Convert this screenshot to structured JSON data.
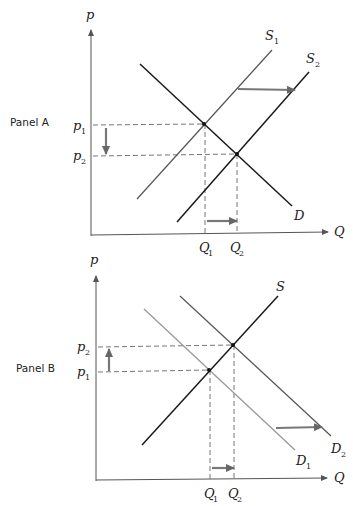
{
  "panels": [
    {
      "id": "A",
      "label": "Panel A",
      "axes": {
        "y": "p",
        "x": "Q"
      },
      "curves": {
        "supply_old": {
          "name": "S",
          "sub": "1"
        },
        "supply_new": {
          "name": "S",
          "sub": "2"
        },
        "demand": {
          "name": "D",
          "sub": ""
        }
      },
      "prices": [
        {
          "name": "p",
          "sub": "1"
        },
        {
          "name": "p",
          "sub": "2"
        }
      ],
      "quantities": [
        {
          "name": "Q",
          "sub": "1"
        },
        {
          "name": "Q",
          "sub": "2"
        }
      ],
      "description": "Supply shifts right from S1 to S2; price falls from p1 to p2; quantity rises from Q1 to Q2"
    },
    {
      "id": "B",
      "label": "Panel B",
      "axes": {
        "y": "p",
        "x": "Q"
      },
      "curves": {
        "supply": {
          "name": "S",
          "sub": ""
        },
        "demand_old": {
          "name": "D",
          "sub": "1"
        },
        "demand_new": {
          "name": "D",
          "sub": "2"
        }
      },
      "prices": [
        {
          "name": "p",
          "sub": "2"
        },
        {
          "name": "p",
          "sub": "1"
        }
      ],
      "quantities": [
        {
          "name": "Q",
          "sub": "1"
        },
        {
          "name": "Q",
          "sub": "2"
        }
      ],
      "description": "Demand shifts right from D1 to D2; price rises from p1 to p2; quantity rises from Q1 to Q2"
    }
  ],
  "colors": {
    "dark_line": "#1a1a1a",
    "light_line": "#999999",
    "axis": "#555555",
    "arrow": "#777777"
  }
}
